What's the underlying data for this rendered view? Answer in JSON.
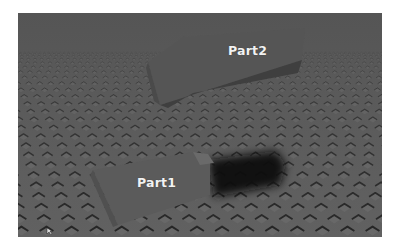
{
  "viewport": {
    "scene": "baseplate-3d-viewport",
    "colors": {
      "floor": "#5a5a5a",
      "floor_far": "#585858",
      "stud_shadow": "#2a2a2a",
      "stud_highlight": "#6e6e6e",
      "part_top": "#565656",
      "part_side": "#474747",
      "shadow": "#111111",
      "label": "#f2f2f2"
    }
  },
  "parts": [
    {
      "name": "Part1",
      "label": "Part1",
      "state": "resting-on-baseplate",
      "casts_shadow": true
    },
    {
      "name": "Part2",
      "label": "Part2",
      "state": "floating",
      "casts_shadow": false
    }
  ]
}
